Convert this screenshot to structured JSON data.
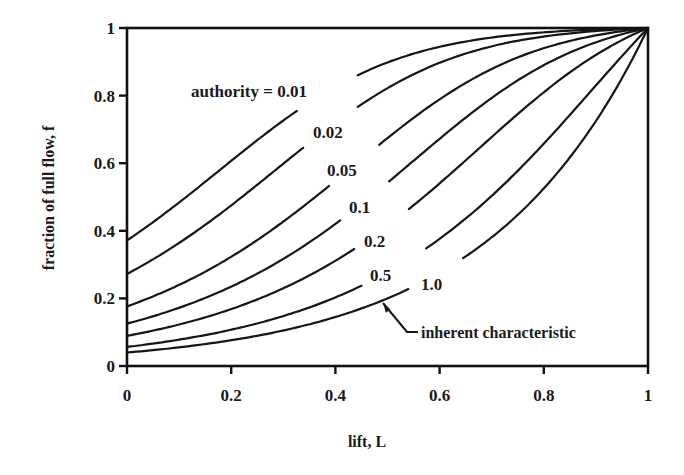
{
  "chart_data": {
    "type": "line",
    "title": "",
    "xlabel": "lift, L",
    "ylabel": "fraction of full flow, f",
    "xlim": [
      0,
      1
    ],
    "ylim": [
      0,
      1
    ],
    "grid": false,
    "legend": "inline curve labels",
    "x_ticks": [
      "0",
      "0.2",
      "0.4",
      "0.6",
      "0.8",
      "1"
    ],
    "y_ticks": [
      "0",
      "0.2",
      "0.4",
      "0.6",
      "0.8",
      "1"
    ],
    "x": [
      0,
      0.1,
      0.2,
      0.3,
      0.4,
      0.5,
      0.6,
      0.7,
      0.8,
      0.9,
      1.0
    ],
    "series": [
      {
        "name": "authority = 0.01",
        "label": "authority = 0.01",
        "authority": 0.01,
        "values": [
          0.372,
          0.482,
          0.594,
          0.698,
          0.785,
          0.853,
          0.903,
          0.939,
          0.963,
          0.98,
          1.0
        ],
        "gap": [
          0.326,
          0.443
        ]
      },
      {
        "name": "0.02",
        "label": "0.02",
        "authority": 0.02,
        "values": [
          0.272,
          0.36,
          0.458,
          0.561,
          0.661,
          0.751,
          0.827,
          0.887,
          0.932,
          0.965,
          1.0
        ],
        "gap": [
          0.338,
          0.443
        ]
      },
      {
        "name": "0.05",
        "label": "0.05",
        "authority": 0.05,
        "values": [
          0.176,
          0.236,
          0.307,
          0.39,
          0.482,
          0.579,
          0.676,
          0.766,
          0.846,
          0.921,
          1.0
        ],
        "gap": [
          0.388,
          0.484
        ]
      },
      {
        "name": "0.1",
        "label": "0.1",
        "authority": 0.1,
        "values": [
          0.126,
          0.17,
          0.224,
          0.29,
          0.368,
          0.457,
          0.556,
          0.659,
          0.764,
          0.875,
          1.0
        ],
        "gap": [
          0.409,
          0.503
        ]
      },
      {
        "name": "0.2",
        "label": "0.2",
        "authority": 0.2,
        "values": [
          0.089,
          0.121,
          0.16,
          0.21,
          0.272,
          0.347,
          0.436,
          0.542,
          0.663,
          0.805,
          1.0
        ],
        "gap": [
          0.436,
          0.541
        ]
      },
      {
        "name": "0.5",
        "label": "0.5",
        "authority": 0.5,
        "values": [
          0.057,
          0.076,
          0.102,
          0.135,
          0.178,
          0.233,
          0.302,
          0.391,
          0.503,
          0.673,
          1.0
        ],
        "gap": [
          0.45,
          0.574
        ]
      },
      {
        "name": "1.0 (inherent characteristic)",
        "label": "1.0",
        "authority": 1.0,
        "values": [
          0.04,
          0.055,
          0.076,
          0.105,
          0.145,
          0.2,
          0.276,
          0.381,
          0.525,
          0.725,
          1.0
        ],
        "gap": [
          0.54,
          0.645
        ]
      }
    ],
    "annotations": [
      {
        "text": "inherent characteristic",
        "points_to": "authority = 1.0 curve at L≈0.49"
      }
    ],
    "model": {
      "inherent": "equal percentage, f_inherent = 25^(L-1)",
      "installed": "f = 1/sqrt((1-a) + a/f_inherent^2)"
    }
  },
  "labels": {
    "xlabel": "lift, L",
    "ylabel": "fraction of full flow, f",
    "annotation": "inherent characteristic"
  }
}
